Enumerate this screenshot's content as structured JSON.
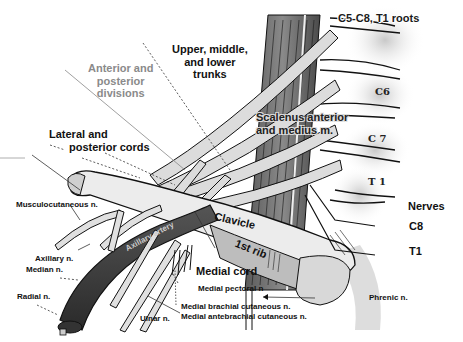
{
  "diagram": {
    "labels": {
      "trunks": [
        "Upper, middle,",
        "and lower",
        "trunks"
      ],
      "divisions": [
        "Anterior and",
        "posterior",
        "divisions"
      ],
      "cords": [
        "Lateral and",
        "posterior cords"
      ],
      "roots": "C5-C8, T1 roots",
      "c6": "C6",
      "c7": "C 7",
      "t1_vertebra": "T 1",
      "scalenus": [
        "Scalenus anterior",
        "and medius m."
      ],
      "nerves_heading": "Nerves",
      "nerve_c8": "C8",
      "nerve_t1": "T1",
      "clavicle": "Clavicle",
      "first_rib": "1st rib",
      "axillary_artery": "Axillary artery",
      "musculocutaneous": "Musculocutaneous n.",
      "axillary_n": "Axillary n.",
      "median_n": "Median n.",
      "radial_n": "Radial n.",
      "ulnar_n": "Ulnar n.",
      "medial_cord": "Medial cord",
      "medial_pectoral": "Medial pectoral n",
      "medial_brachial_cutaneous": "Medial brachial cutaneous n.",
      "medial_antebrachial_cutaneous": "Medial antebrachial cutaneous n.",
      "phrenic": "Phrenic n."
    },
    "colors": {
      "background": "#ffffff",
      "bone": "#e6e6e6",
      "nerve": "#dcdcdc",
      "muscle": "#6e6e6e",
      "artery": "#3c3c3c",
      "outline": "#111111",
      "grey_label": "#8a8a8a"
    }
  }
}
